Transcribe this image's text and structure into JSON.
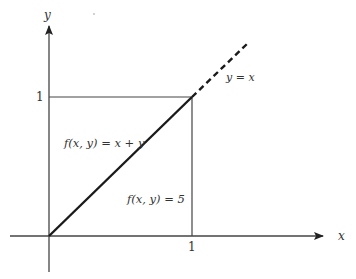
{
  "diagram": {
    "type": "region-plot",
    "axes": {
      "x_label": "x",
      "y_label": "y",
      "x_tick": "1",
      "y_tick": "1"
    },
    "line": {
      "label": "y = x",
      "solid_segment": "from (0,0) to (1,1)",
      "dashed_extension": "beyond (1,1)"
    },
    "regions": [
      {
        "name": "above-diagonal",
        "label": "f(x, y) = x + y"
      },
      {
        "name": "below-diagonal",
        "label": "f(x, y) = 5"
      }
    ],
    "colors": {
      "axis": "#444444",
      "line": "#222222",
      "text": "#333333",
      "background": "#ffffff"
    }
  }
}
